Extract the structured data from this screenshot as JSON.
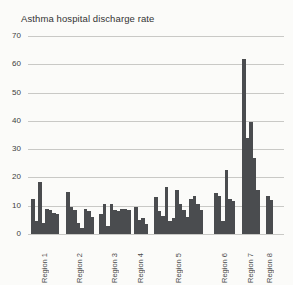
{
  "title": "Asthma hospital discharge rate",
  "chart_data": {
    "type": "bar",
    "title": "Asthma hospital discharge rate",
    "xlabel": "",
    "ylabel": "",
    "ylim": [
      0,
      70
    ],
    "yticks": [
      0,
      10,
      20,
      30,
      40,
      50,
      60,
      70
    ],
    "grid": true,
    "legend": false,
    "bar_color": "#4a4c4f",
    "gridline_color": "#c9c9c6",
    "groups": [
      {
        "label": "Region 1",
        "values": [
          12.5,
          4.5,
          18.5,
          4,
          9,
          8.5,
          7.5,
          7
        ]
      },
      {
        "label": "Region 2",
        "values": [
          15,
          9.5,
          8.5,
          4,
          2,
          9,
          8,
          6
        ]
      },
      {
        "label": "Region 3",
        "values": [
          7,
          10.5,
          3,
          10.5,
          8.5,
          8,
          9,
          9,
          8.5
        ]
      },
      {
        "label": "Region 4",
        "values": [
          9.5,
          5,
          5.5,
          3.5
        ]
      },
      {
        "label": "Region 5",
        "values": [
          13,
          8,
          6.5,
          16.5,
          4.5,
          5.5,
          15.5,
          10.5,
          8.5,
          6,
          12.5,
          13.5,
          10.5,
          8.5
        ]
      },
      {
        "label": "Region 6",
        "values": [
          14.5,
          13.5,
          4.5,
          22.5,
          12.5,
          11.5
        ]
      },
      {
        "label": "Region 7",
        "values": [
          62,
          34,
          39.5,
          27,
          15.5
        ]
      },
      {
        "label": "Region 8",
        "values": [
          13.5,
          12
        ]
      }
    ]
  }
}
